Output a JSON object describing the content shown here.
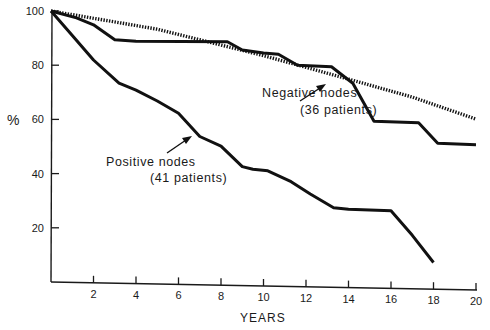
{
  "chart_data": {
    "type": "line",
    "title": "",
    "xlabel": "YEARS",
    "ylabel": "%",
    "xlim": [
      0,
      20
    ],
    "ylim": [
      0,
      100
    ],
    "grid": false,
    "x_ticks": [
      2,
      4,
      6,
      8,
      10,
      12,
      14,
      16,
      18,
      20
    ],
    "y_ticks": [
      20,
      40,
      60,
      80,
      100
    ],
    "series": [
      {
        "name": "Negative nodes (36 patients)",
        "style": "solid",
        "points": [
          [
            0,
            100
          ],
          [
            1.2,
            97.5
          ],
          [
            2,
            95
          ],
          [
            3,
            89.5
          ],
          [
            4,
            89
          ],
          [
            8.3,
            89
          ],
          [
            9,
            86
          ],
          [
            10,
            85
          ],
          [
            10.7,
            84.5
          ],
          [
            11.6,
            80.5
          ],
          [
            13.2,
            80
          ],
          [
            13.7,
            77
          ],
          [
            14.2,
            74
          ],
          [
            15.2,
            60
          ],
          [
            17.3,
            59.5
          ],
          [
            18.2,
            52
          ],
          [
            20,
            51.5
          ]
        ]
      },
      {
        "name": "Positive nodes (41 patients)",
        "style": "solid",
        "points": [
          [
            0,
            100
          ],
          [
            1,
            91
          ],
          [
            2,
            82
          ],
          [
            3.2,
            73.5
          ],
          [
            4,
            71
          ],
          [
            5,
            67
          ],
          [
            6,
            62.5
          ],
          [
            7,
            54
          ],
          [
            8,
            50.5
          ],
          [
            9,
            43
          ],
          [
            9.5,
            42
          ],
          [
            10.2,
            41.5
          ],
          [
            11.3,
            37.5
          ],
          [
            12.2,
            33
          ],
          [
            13.3,
            28
          ],
          [
            14,
            27.5
          ],
          [
            16,
            27
          ],
          [
            17,
            18
          ],
          [
            18,
            8
          ]
        ]
      },
      {
        "name": "Expected (reference)",
        "style": "dotted",
        "points": [
          [
            0,
            100
          ],
          [
            5,
            93.5
          ],
          [
            10,
            84
          ],
          [
            14,
            75.5
          ],
          [
            17,
            69
          ],
          [
            20,
            61
          ]
        ]
      }
    ],
    "annotations": [
      {
        "line1": "Negative nodes",
        "line2": "(36 patients)",
        "points_to": [
          12.5,
          80
        ]
      },
      {
        "line1": "Positive nodes",
        "line2": "(41 patients)",
        "points_to": [
          7.3,
          53
        ]
      }
    ]
  },
  "labels": {
    "y_symbol": "%",
    "x_title": "YEARS"
  },
  "colors": {
    "ink": "#111111",
    "background": "#ffffff"
  }
}
